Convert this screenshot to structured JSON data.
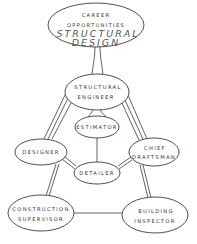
{
  "diagram": {
    "title": {
      "line1": "CAREER",
      "line2": "OPPORTUNITIES",
      "line3": "STRUCTURAL",
      "line4": "DESIGN"
    },
    "nodes": {
      "structural_engineer": {
        "line1": "STRUCTURAL",
        "line2": "ENGINEER"
      },
      "estimator": {
        "line1": "ESTIMATOR"
      },
      "designer": {
        "line1": "DESIGNER"
      },
      "chief_draftsman": {
        "line1": "CHIEF",
        "line2": "DRAFTSMAN"
      },
      "detailer": {
        "line1": "DETAILER"
      },
      "construction_supervisor": {
        "line1": "CONSTRUCTION",
        "line2": "SUPERVISOR"
      },
      "building_inspector": {
        "line1": "BUILDING",
        "line2": "INSPECTOR"
      }
    },
    "edges": [
      [
        "career_opportunities",
        "structural_engineer"
      ],
      [
        "structural_engineer",
        "estimator"
      ],
      [
        "structural_engineer",
        "designer"
      ],
      [
        "structural_engineer",
        "chief_draftsman"
      ],
      [
        "estimator",
        "detailer"
      ],
      [
        "designer",
        "detailer"
      ],
      [
        "chief_draftsman",
        "detailer"
      ],
      [
        "designer",
        "construction_supervisor"
      ],
      [
        "chief_draftsman",
        "building_inspector"
      ],
      [
        "construction_supervisor",
        "building_inspector"
      ]
    ],
    "colors": {
      "line": "#3a3a3a",
      "text": "#333333",
      "background": "#ffffff"
    }
  }
}
